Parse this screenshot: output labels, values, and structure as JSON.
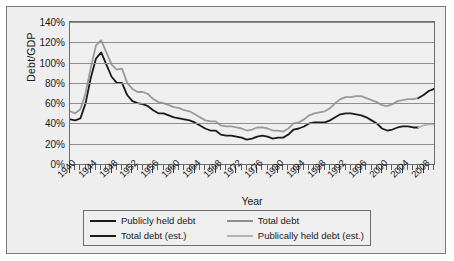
{
  "chart_data": {
    "type": "line",
    "title": "",
    "xlabel": "Year",
    "ylabel": "Debt/GDP",
    "xlim": [
      1940,
      2010
    ],
    "ylim": [
      0,
      140
    ],
    "grid": true,
    "legend_position": "bottom",
    "y_ticks": [
      "0%",
      "20%",
      "40%",
      "60%",
      "80%",
      "100%",
      "120%",
      "140%"
    ],
    "y_tick_values": [
      0,
      20,
      40,
      60,
      80,
      100,
      120,
      140
    ],
    "x_ticks": [
      "1940",
      "1944",
      "1948",
      "1952",
      "1956",
      "1960",
      "1964",
      "1968",
      "1972",
      "1976",
      "1980",
      "1984",
      "1988",
      "1992",
      "1996",
      "2000",
      "2004",
      "2008"
    ],
    "x_tick_values": [
      1940,
      1944,
      1948,
      1952,
      1956,
      1960,
      1964,
      1968,
      1972,
      1976,
      1980,
      1984,
      1988,
      1992,
      1996,
      2000,
      2004,
      2008
    ],
    "minor_tick_interval": 1,
    "series": [
      {
        "name": "Publicly held debt",
        "color": "#1a1a1a",
        "x": [
          1940,
          1941,
          1942,
          1943,
          1944,
          1945,
          1946,
          1947,
          1948,
          1949,
          1950,
          1951,
          1952,
          1953,
          1954,
          1955,
          1956,
          1957,
          1958,
          1959,
          1960,
          1961,
          1962,
          1963,
          1964,
          1965,
          1966,
          1967,
          1968,
          1969,
          1970,
          1971,
          1972,
          1973,
          1974,
          1975,
          1976,
          1977,
          1978,
          1979,
          1980,
          1981,
          1982,
          1983,
          1984,
          1985,
          1986,
          1987,
          1988,
          1989,
          1990,
          1991,
          1992,
          1993,
          1994,
          1995,
          1996,
          1997,
          1998,
          1999,
          2000,
          2001,
          2002,
          2003,
          2004,
          2005,
          2006,
          2007
        ],
        "values": [
          44,
          43,
          45,
          60,
          85,
          104,
          110,
          98,
          86,
          80,
          80,
          68,
          62,
          60,
          59,
          57,
          53,
          50,
          50,
          48,
          46,
          45,
          44,
          43,
          41,
          38,
          35,
          33,
          33,
          29,
          28,
          28,
          27,
          26,
          24,
          25,
          27,
          28,
          27,
          25,
          26,
          26,
          29,
          34,
          35,
          37,
          40,
          41,
          41,
          41,
          43,
          46,
          49,
          50,
          50,
          49,
          48,
          46,
          43,
          40,
          35,
          33,
          34,
          36,
          37,
          37,
          36,
          36
        ]
      },
      {
        "name": "Total debt",
        "color": "#9a9a9a",
        "x": [
          1940,
          1941,
          1942,
          1943,
          1944,
          1945,
          1946,
          1947,
          1948,
          1949,
          1950,
          1951,
          1952,
          1953,
          1954,
          1955,
          1956,
          1957,
          1958,
          1959,
          1960,
          1961,
          1962,
          1963,
          1964,
          1965,
          1966,
          1967,
          1968,
          1969,
          1970,
          1971,
          1972,
          1973,
          1974,
          1975,
          1976,
          1977,
          1978,
          1979,
          1980,
          1981,
          1982,
          1983,
          1984,
          1985,
          1986,
          1987,
          1988,
          1989,
          1990,
          1991,
          1992,
          1993,
          1994,
          1995,
          1996,
          1997,
          1998,
          1999,
          2000,
          2001,
          2002,
          2003,
          2004,
          2005,
          2006,
          2007
        ],
        "values": [
          52,
          50,
          54,
          70,
          95,
          117,
          122,
          110,
          98,
          93,
          94,
          80,
          74,
          71,
          71,
          69,
          64,
          61,
          60,
          58,
          56,
          55,
          53,
          52,
          49,
          46,
          43,
          42,
          42,
          38,
          37,
          37,
          36,
          35,
          33,
          34,
          36,
          36,
          35,
          33,
          33,
          32,
          35,
          40,
          41,
          44,
          48,
          50,
          51,
          52,
          55,
          60,
          64,
          66,
          66,
          67,
          67,
          65,
          63,
          61,
          58,
          57,
          59,
          62,
          63,
          64,
          64,
          65
        ]
      },
      {
        "name": "Total debt (est.)",
        "color": "#1a1a1a",
        "x": [
          2007,
          2008,
          2009,
          2010
        ],
        "values": [
          65,
          68,
          72,
          74
        ]
      },
      {
        "name": "Publically held debt (est.)",
        "color": "#b4b4b4",
        "x": [
          2007,
          2008,
          2009,
          2010
        ],
        "values": [
          36,
          38,
          39,
          39
        ]
      }
    ]
  },
  "legend": {
    "entries": [
      {
        "label": "Publicly held debt",
        "color": "#1a1a1a"
      },
      {
        "label": "Total debt",
        "color": "#8f8f8f"
      },
      {
        "label": "Total debt (est.)",
        "color": "#1a1a1a"
      },
      {
        "label": "Publically held debt (est.)",
        "color": "#b4b4b4"
      }
    ]
  }
}
